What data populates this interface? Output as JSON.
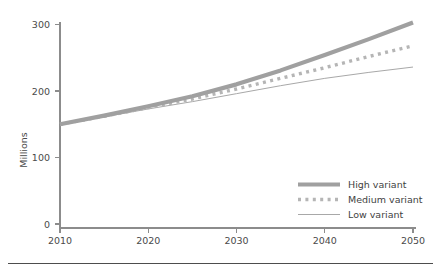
{
  "chart_data": {
    "type": "line",
    "title": "",
    "subtitle": "",
    "xlabel": "",
    "ylabel": "Millions",
    "xlim": [
      2010,
      2050
    ],
    "ylim": [
      0,
      300
    ],
    "x_ticks": [
      "2010",
      "2020",
      "2030",
      "2040",
      "2050"
    ],
    "y_ticks": [
      "0",
      "100",
      "200",
      "300"
    ],
    "grid": false,
    "legend_position": "bottom-right",
    "x": [
      2010,
      2015,
      2020,
      2025,
      2030,
      2035,
      2040,
      2045,
      2050
    ],
    "series": [
      {
        "name": "High variant",
        "style": "thick-solid",
        "color": "#a0a0a0",
        "values": [
          150,
          163,
          177,
          192,
          210,
          231,
          254,
          278,
          303
        ]
      },
      {
        "name": "Medium variant",
        "style": "dotted",
        "color": "#b5b5b5",
        "values": [
          150,
          162,
          175,
          188,
          203,
          219,
          235,
          252,
          268
        ]
      },
      {
        "name": "Low variant",
        "style": "thin-solid",
        "color": "#a8a8a8",
        "values": [
          150,
          161,
          173,
          184,
          196,
          208,
          219,
          228,
          236
        ]
      }
    ]
  },
  "axes": {
    "y_axis_title": "Millions",
    "y_tick_labels": [
      "300",
      "200",
      "100",
      "0"
    ],
    "x_tick_labels": [
      "2010",
      "2020",
      "2030",
      "2040",
      "2050"
    ]
  },
  "legend": {
    "items": [
      {
        "label": "High variant",
        "swatch": "thick-solid-line-swatch"
      },
      {
        "label": "Medium variant",
        "swatch": "dotted-line-swatch"
      },
      {
        "label": "Low variant",
        "swatch": "thin-solid-line-swatch"
      }
    ]
  },
  "colors": {
    "high": "#a0a0a0",
    "medium": "#b5b5b5",
    "low": "#a8a8a8",
    "axis": "#8c8c8c",
    "text": "#3f3f3f",
    "rule": "#4d4d4d",
    "background": "#ffffff"
  }
}
